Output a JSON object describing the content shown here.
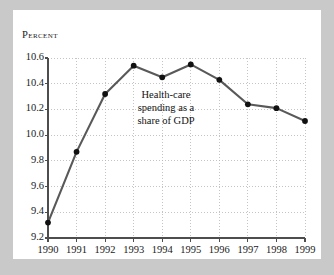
{
  "chart_data": {
    "type": "line",
    "title": "",
    "subtitle": "",
    "xlabel": "",
    "ylabel": "Percent",
    "categories": [
      "1990",
      "1991",
      "1992",
      "1993",
      "1994",
      "1995",
      "1996",
      "1997",
      "1998",
      "1999"
    ],
    "x": [
      1990,
      1991,
      1992,
      1993,
      1994,
      1995,
      1996,
      1997,
      1998,
      1999
    ],
    "values": [
      9.32,
      9.87,
      10.32,
      10.54,
      10.45,
      10.55,
      10.43,
      10.24,
      10.21,
      10.11
    ],
    "series": [
      {
        "name": "Health-care spending as a share of GDP",
        "values": [
          9.32,
          9.87,
          10.32,
          10.54,
          10.45,
          10.55,
          10.43,
          10.24,
          10.21,
          10.11
        ]
      }
    ],
    "ylim": [
      9.2,
      10.6
    ],
    "xlim": [
      1990,
      1999
    ],
    "yticks": [
      "9.2",
      "9.4",
      "9.6",
      "9.8",
      "10.0",
      "10.2",
      "10.4",
      "10.6"
    ],
    "ytick_values": [
      9.2,
      9.4,
      9.6,
      9.8,
      10.0,
      10.2,
      10.4,
      10.6
    ],
    "xticks": [
      "1990",
      "1991",
      "1992",
      "1993",
      "1994",
      "1995",
      "1996",
      "1997",
      "1998",
      "1999"
    ],
    "grid": true,
    "grid_style": "dotted",
    "legend": "none",
    "annotations": [
      {
        "lines": [
          "Health-care",
          "spending as a",
          "share of GDP"
        ],
        "text": "Health-care spending as a share of GDP"
      }
    ]
  },
  "axis": {
    "y_title": "Percent"
  },
  "annotation": {
    "line1": "Health-care",
    "line2": "spending as a",
    "line3": "share of GDP"
  },
  "colors": {
    "line": "#595959",
    "marker": "#111111",
    "axis": "#4d4d4d",
    "grid": "#b5b5b5",
    "frame": "#c9c9c9",
    "card": "#ffffff",
    "text": "#1a1a1a"
  }
}
